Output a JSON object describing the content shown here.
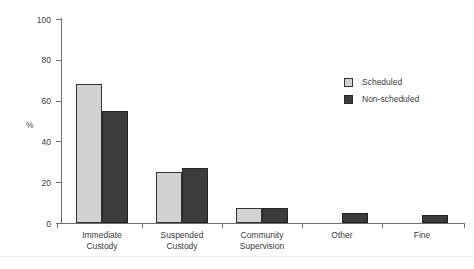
{
  "chart_data": {
    "type": "bar",
    "title": "",
    "xlabel": "",
    "ylabel": "%",
    "ylim": [
      0,
      100
    ],
    "yticks": [
      0,
      20,
      40,
      60,
      80,
      100
    ],
    "ytick_labels": [
      "0",
      "20",
      "40",
      "60",
      "80",
      "100"
    ],
    "grid": false,
    "legend_position": "upper right",
    "categories": [
      "Immediate Custody",
      "Suspended Custody",
      "Community Supervision",
      "Other",
      "Fine"
    ],
    "category_lines": [
      [
        "Immediate",
        "Custody"
      ],
      [
        "Suspended",
        "Custody"
      ],
      [
        "Community",
        "Supervision"
      ],
      [
        "Other",
        ""
      ],
      [
        "Fine",
        ""
      ]
    ],
    "series": [
      {
        "name": "Scheduled",
        "color": "#d2d2d2",
        "values": [
          68,
          25,
          7.5,
          0,
          0
        ]
      },
      {
        "name": "Non-scheduled",
        "color": "#3c3c3c",
        "values": [
          55,
          27,
          7.5,
          5,
          4
        ]
      }
    ]
  },
  "legend": {
    "items": [
      {
        "label": "Scheduled",
        "swatch": "scheduled"
      },
      {
        "label": "Non-scheduled",
        "swatch": "nonscheduled"
      }
    ]
  },
  "axis": {
    "y_title": "%"
  }
}
